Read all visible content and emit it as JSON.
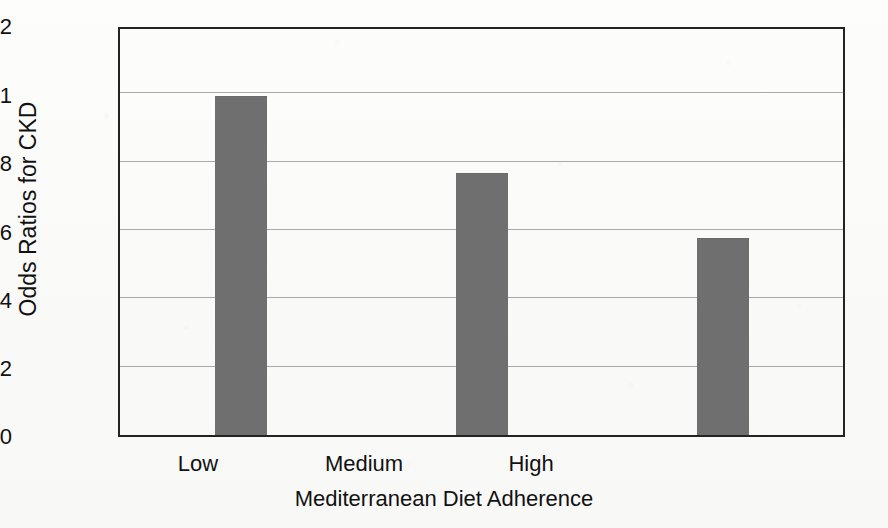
{
  "chart_data": {
    "type": "bar",
    "title": "",
    "subtitle": "",
    "xlabel": "Mediterranean Diet Adherence",
    "ylabel": "Odds Ratios for CKD",
    "categories": [
      "Low",
      "Medium",
      "High"
    ],
    "values": [
      1.0,
      0.77,
      0.58
    ],
    "ylim": [
      0,
      1.2
    ],
    "ytick_labels": [
      "0",
      "0.2",
      "0.4",
      "0.6",
      "0.8",
      "1",
      "1.2"
    ],
    "ytick_values": [
      0,
      0.2,
      0.4,
      0.6,
      0.8,
      1,
      1.2
    ],
    "grid": "horizontal",
    "legend": "none",
    "bar_color": "#6f6f6f",
    "axis_color": "#232323",
    "gridline_color": "#a9a9a9",
    "background_color": "#fcfcfb"
  },
  "axes": {
    "y_title": "Odds Ratios for CKD",
    "x_title": "Mediterranean Diet Adherence"
  }
}
